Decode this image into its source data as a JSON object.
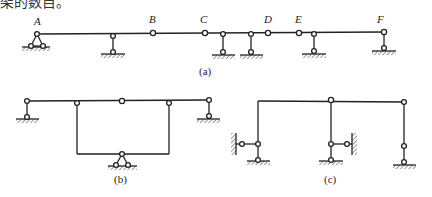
{
  "header": {
    "clipped_text": "架的数目。"
  },
  "figure_a": {
    "caption": "(a)",
    "labels": {
      "A": "A",
      "B": "B",
      "C": "C",
      "D": "D",
      "E": "E",
      "F": "F"
    }
  },
  "figure_b": {
    "caption": "(b)"
  },
  "figure_c": {
    "caption": "(c)"
  },
  "colors": {
    "line": "#222222",
    "background": "#ffffff"
  }
}
